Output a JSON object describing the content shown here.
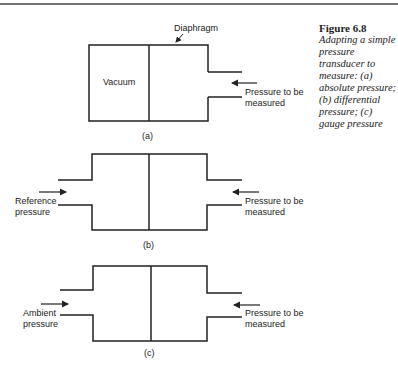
{
  "figure": {
    "number": "Figure 6.8",
    "caption": "Adapting a simple pressure transducer to measure: (a) absolute pressure; (b) differential pressure; (c) gauge pressure"
  },
  "diagrams": {
    "a": {
      "label": "(a)",
      "diaphragm_label": "Diaphragm",
      "left_chamber_label": "Vacuum",
      "right_label_line1": "Pressure to be",
      "right_label_line2": "measured"
    },
    "b": {
      "label": "(b)",
      "left_label_line1": "Reference",
      "left_label_line2": "pressure",
      "right_label_line1": "Pressure to be",
      "right_label_line2": "measured"
    },
    "c": {
      "label": "(c)",
      "left_label_line1": "Ambient",
      "left_label_line2": "pressure",
      "right_label_line1": "Pressure to be",
      "right_label_line2": "measured"
    }
  }
}
